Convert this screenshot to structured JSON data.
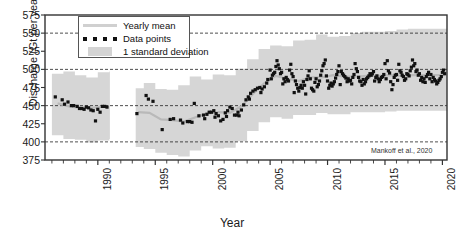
{
  "chart_data": {
    "type": "scatter",
    "title": "",
    "subtitle": "",
    "xlabel": "Year",
    "ylabel": "Discharge (Gt per year)",
    "xlim": [
      1985.4,
      2020.4
    ],
    "ylim": [
      375,
      575
    ],
    "yticks": [
      375,
      400,
      425,
      450,
      475,
      500,
      525,
      550,
      575
    ],
    "xticks": [
      1990,
      1995,
      2000,
      2005,
      2010,
      2015,
      2020
    ],
    "xtick_minor_step": 1,
    "gridlines": [
      400,
      450,
      500,
      550
    ],
    "grid": "horizontal-dashed",
    "legend_position": "top-left-inside",
    "annotation": "Mankoff et al., 2020",
    "legend": [
      {
        "label": "Yearly mean",
        "key": "line",
        "color": "#d0d0d0"
      },
      {
        "label": "Data points",
        "key": "dots",
        "color": "#111111"
      },
      {
        "label": "1 standard deviation",
        "key": "patch",
        "color": "#d4d4d4"
      }
    ],
    "series": [
      {
        "name": "Yearly mean",
        "type": "line",
        "color": "#d0d0d0",
        "x": [
          1986.5,
          1987.5,
          1988.5,
          1989.5,
          1990.5,
          1993.5,
          1994.5,
          1995.5,
          1996.5,
          1997.5,
          1998.5,
          1999.5,
          2000.5,
          2001.5,
          2002.5,
          2003.5,
          2004.5,
          2005.5,
          2006.5,
          2007.5,
          2008.5,
          2009.5,
          2010.5,
          2011.5,
          2012.5,
          2013.5,
          2014.5,
          2015.5,
          2016.5,
          2017.5,
          2018.5,
          2019.5,
          2020.2
        ],
        "values": [
          453,
          449,
          447,
          447,
          449,
          441,
          440,
          431,
          430,
          428,
          434,
          439,
          441,
          440,
          449,
          466,
          481,
          491,
          487,
          484,
          489,
          489,
          492,
          490,
          490,
          491,
          491,
          492,
          491,
          492,
          492,
          492,
          492
        ]
      },
      {
        "name": "1 standard deviation (upper)",
        "type": "band-upper",
        "color": "#d4d4d4",
        "x": [
          1986.0,
          1987.0,
          1988.0,
          1989.0,
          1990.0,
          1991.0,
          1993.3,
          1994.0,
          1995.0,
          1996.0,
          1997.0,
          1998.0,
          1999.0,
          2000.0,
          2001.0,
          2002.0,
          2003.0,
          2004.0,
          2005.0,
          2006.0,
          2007.0,
          2008.0,
          2009.0,
          2010.0,
          2011.0,
          2012.0,
          2013.0,
          2014.0,
          2015.0,
          2016.0,
          2017.0,
          2018.0,
          2019.0,
          2020.2
        ],
        "values": [
          494,
          497,
          492,
          489,
          496,
          497,
          474,
          481,
          473,
          472,
          478,
          490,
          486,
          493,
          492,
          501,
          514,
          528,
          533,
          532,
          540,
          541,
          548,
          545,
          546,
          550,
          552,
          552,
          553,
          555,
          556,
          556,
          556,
          556
        ]
      },
      {
        "name": "1 standard deviation (lower)",
        "type": "band-lower",
        "color": "#d4d4d4",
        "x": [
          1986.0,
          1987.0,
          1988.0,
          1989.0,
          1990.0,
          1991.0,
          1993.3,
          1994.0,
          1995.0,
          1996.0,
          1997.0,
          1998.0,
          1999.0,
          2000.0,
          2001.0,
          2002.0,
          2003.0,
          2004.0,
          2005.0,
          2006.0,
          2007.0,
          2008.0,
          2009.0,
          2010.0,
          2011.0,
          2012.0,
          2013.0,
          2014.0,
          2015.0,
          2016.0,
          2017.0,
          2018.0,
          2019.0,
          2020.2
        ],
        "values": [
          409,
          404,
          403,
          399,
          402,
          404,
          393,
          390,
          385,
          382,
          380,
          388,
          394,
          391,
          392,
          401,
          415,
          427,
          434,
          432,
          437,
          437,
          440,
          438,
          438,
          441,
          441,
          441,
          442,
          443,
          443,
          443,
          443,
          443
        ]
      },
      {
        "name": "Data points",
        "type": "scatter",
        "color": "#111111",
        "points": [
          [
            1986.3,
            462
          ],
          [
            1986.9,
            458
          ],
          [
            1987.1,
            452
          ],
          [
            1987.4,
            455
          ],
          [
            1987.7,
            450
          ],
          [
            1987.9,
            450
          ],
          [
            1988.2,
            449
          ],
          [
            1988.4,
            446
          ],
          [
            1988.6,
            446
          ],
          [
            1988.8,
            445
          ],
          [
            1989.0,
            448
          ],
          [
            1989.2,
            447
          ],
          [
            1989.4,
            444
          ],
          [
            1989.6,
            443
          ],
          [
            1989.8,
            429
          ],
          [
            1990.0,
            445
          ],
          [
            1990.2,
            441
          ],
          [
            1990.4,
            449
          ],
          [
            1990.6,
            449
          ],
          [
            1990.8,
            448
          ],
          [
            1993.4,
            439
          ],
          [
            1994.2,
            464
          ],
          [
            1994.4,
            459
          ],
          [
            1994.8,
            456
          ],
          [
            1995.6,
            417
          ],
          [
            1996.3,
            431
          ],
          [
            1997.4,
            426
          ],
          [
            1997.8,
            428
          ],
          [
            1998.0,
            428
          ],
          [
            1998.4,
            453
          ],
          [
            1998.8,
            436
          ],
          [
            1999.2,
            437
          ],
          [
            1999.5,
            438
          ],
          [
            1999.7,
            441
          ],
          [
            1999.9,
            441
          ],
          [
            2000.1,
            443
          ],
          [
            2000.3,
            439
          ],
          [
            2000.5,
            436
          ],
          [
            2000.7,
            429
          ],
          [
            2000.9,
            431
          ],
          [
            2001.1,
            440
          ],
          [
            2001.3,
            443
          ],
          [
            2001.5,
            448
          ],
          [
            2001.7,
            446
          ],
          [
            2001.9,
            437
          ],
          [
            2002.1,
            437
          ],
          [
            2002.3,
            436
          ],
          [
            2002.5,
            444
          ],
          [
            2002.7,
            451
          ],
          [
            2002.9,
            458
          ],
          [
            2003.1,
            462
          ],
          [
            2003.3,
            467
          ],
          [
            2003.5,
            470
          ],
          [
            2003.7,
            472
          ],
          [
            2003.9,
            474
          ],
          [
            2004.1,
            475
          ],
          [
            2004.3,
            473
          ],
          [
            2004.5,
            476
          ],
          [
            2004.7,
            481
          ],
          [
            2004.8,
            486
          ],
          [
            2005.0,
            499
          ],
          [
            2005.2,
            492
          ],
          [
            2005.4,
            496
          ],
          [
            2005.6,
            512
          ],
          [
            2005.8,
            501
          ],
          [
            2006.0,
            496
          ],
          [
            2006.2,
            487
          ],
          [
            2006.4,
            489
          ],
          [
            2006.6,
            484
          ],
          [
            2006.8,
            507
          ],
          [
            2007.0,
            490
          ],
          [
            2007.2,
            484
          ],
          [
            2007.4,
            474
          ],
          [
            2007.6,
            475
          ],
          [
            2007.8,
            474
          ],
          [
            2008.0,
            478
          ],
          [
            2008.2,
            486
          ],
          [
            2008.4,
            498
          ],
          [
            2008.6,
            474
          ],
          [
            2008.8,
            470
          ],
          [
            2009.0,
            487
          ],
          [
            2009.2,
            479
          ],
          [
            2009.4,
            492
          ],
          [
            2009.6,
            505
          ],
          [
            2009.8,
            513
          ],
          [
            2010.0,
            484
          ],
          [
            2010.2,
            478
          ],
          [
            2010.4,
            477
          ],
          [
            2010.6,
            483
          ],
          [
            2010.8,
            493
          ],
          [
            2011.0,
            505
          ],
          [
            2011.2,
            497
          ],
          [
            2011.4,
            492
          ],
          [
            2011.6,
            488
          ],
          [
            2011.8,
            487
          ],
          [
            2012.0,
            485
          ],
          [
            2012.2,
            489
          ],
          [
            2012.4,
            508
          ],
          [
            2012.6,
            497
          ],
          [
            2012.8,
            484
          ],
          [
            2013.0,
            478
          ],
          [
            2013.2,
            480
          ],
          [
            2013.4,
            487
          ],
          [
            2013.6,
            491
          ],
          [
            2013.8,
            492
          ],
          [
            2014.0,
            497
          ],
          [
            2014.2,
            489
          ],
          [
            2014.4,
            487
          ],
          [
            2014.6,
            486
          ],
          [
            2014.8,
            490
          ],
          [
            2015.0,
            508
          ],
          [
            2015.2,
            512
          ],
          [
            2015.4,
            495
          ],
          [
            2015.6,
            472
          ],
          [
            2015.8,
            489
          ],
          [
            2016.0,
            493
          ],
          [
            2016.2,
            507
          ],
          [
            2016.4,
            496
          ],
          [
            2016.6,
            490
          ],
          [
            2016.8,
            487
          ],
          [
            2017.0,
            493
          ],
          [
            2017.2,
            498
          ],
          [
            2017.4,
            513
          ],
          [
            2017.6,
            508
          ],
          [
            2017.8,
            499
          ],
          [
            2018.0,
            494
          ],
          [
            2018.2,
            489
          ],
          [
            2018.4,
            487
          ],
          [
            2018.6,
            490
          ],
          [
            2018.8,
            496
          ],
          [
            2019.0,
            493
          ],
          [
            2019.2,
            489
          ],
          [
            2019.4,
            484
          ],
          [
            2019.6,
            482
          ],
          [
            2019.8,
            487
          ],
          [
            2020.0,
            496
          ],
          [
            2020.1,
            499
          ],
          [
            2020.2,
            494
          ],
          [
            2005.1,
            487
          ],
          [
            2006.1,
            480
          ],
          [
            2007.1,
            468
          ],
          [
            2008.1,
            466
          ],
          [
            2009.1,
            476
          ],
          [
            2010.1,
            474
          ],
          [
            2011.1,
            479
          ],
          [
            2012.1,
            480
          ],
          [
            2013.1,
            486
          ],
          [
            2014.1,
            484
          ],
          [
            2015.1,
            487
          ],
          [
            2016.1,
            485
          ],
          [
            2017.1,
            491
          ],
          [
            2018.1,
            485
          ],
          [
            2019.1,
            483
          ],
          [
            2004.2,
            468
          ],
          [
            2003.2,
            459
          ],
          [
            2002.2,
            441
          ],
          [
            2001.2,
            435
          ],
          [
            2000.2,
            434
          ],
          [
            1999.3,
            432
          ],
          [
            1998.2,
            427
          ],
          [
            1997.2,
            430
          ],
          [
            1996.6,
            432
          ],
          [
            2005.9,
            494
          ],
          [
            2006.9,
            494
          ],
          [
            2007.9,
            483
          ],
          [
            2008.9,
            482
          ],
          [
            2009.9,
            491
          ],
          [
            2010.9,
            497
          ],
          [
            2011.9,
            484
          ],
          [
            2012.9,
            483
          ],
          [
            2013.9,
            494
          ],
          [
            2014.9,
            493
          ],
          [
            2015.9,
            492
          ],
          [
            2016.9,
            494
          ],
          [
            2017.9,
            492
          ],
          [
            2018.9,
            487
          ],
          [
            2019.9,
            490
          ],
          [
            2017.3,
            503
          ],
          [
            2017.5,
            505
          ],
          [
            2017.7,
            497
          ],
          [
            2018.3,
            483
          ],
          [
            2018.5,
            482
          ],
          [
            2018.7,
            493
          ],
          [
            2019.3,
            486
          ],
          [
            2019.5,
            480
          ],
          [
            2019.7,
            485
          ],
          [
            2016.3,
            498
          ],
          [
            2016.5,
            492
          ],
          [
            2016.7,
            485
          ],
          [
            2015.3,
            498
          ],
          [
            2015.5,
            483
          ],
          [
            2015.7,
            479
          ],
          [
            2014.3,
            491
          ],
          [
            2014.5,
            483
          ],
          [
            2014.7,
            489
          ],
          [
            2013.3,
            483
          ],
          [
            2013.5,
            489
          ],
          [
            2013.7,
            494
          ],
          [
            2012.3,
            493
          ],
          [
            2012.5,
            501
          ],
          [
            2012.7,
            489
          ],
          [
            2011.3,
            494
          ],
          [
            2011.5,
            490
          ],
          [
            2011.7,
            483
          ],
          [
            2010.3,
            481
          ],
          [
            2010.5,
            480
          ],
          [
            2010.7,
            488
          ],
          [
            2009.3,
            484
          ],
          [
            2009.5,
            498
          ],
          [
            2009.7,
            508
          ],
          [
            2008.3,
            491
          ],
          [
            2008.5,
            487
          ],
          [
            2008.7,
            472
          ],
          [
            2007.3,
            479
          ],
          [
            2007.5,
            470
          ],
          [
            2007.7,
            478
          ],
          [
            2006.3,
            483
          ],
          [
            2006.5,
            486
          ],
          [
            2006.7,
            499
          ],
          [
            2005.3,
            494
          ],
          [
            2005.5,
            504
          ],
          [
            2005.7,
            506
          ]
        ]
      }
    ]
  }
}
